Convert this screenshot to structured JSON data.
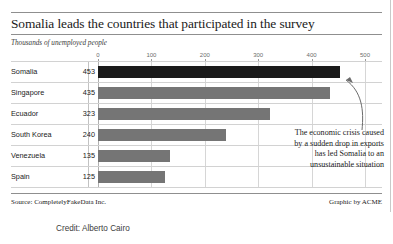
{
  "header": {
    "title": "Somalia leads the countries that participated in the survey",
    "subtitle": "Thousands of unemployed people"
  },
  "footer": {
    "source": "Source: CompletelyFakeData Inc.",
    "graphic_by": "Graphic by ACME",
    "credit": "Credit:  Alberto Cairo"
  },
  "annotation": {
    "line1": "The economic crisis caused",
    "line2": "by a sudden drop in exports",
    "line3": "has led Somalia to an",
    "line4": "unsustainable situation",
    "pointer": "curved-arrow-to-somalia-bar"
  },
  "colors": {
    "bar_default": "#757575",
    "bar_highlight": "#1a1a1a",
    "rule": "#8f8f8f",
    "grid": "#d6d6d6"
  },
  "chart_data": {
    "type": "bar",
    "orientation": "horizontal",
    "title": "Somalia leads the countries that participated in the survey",
    "subtitle": "Thousands of unemployed people",
    "xlabel": "",
    "ylabel": "",
    "xlim": [
      0,
      500
    ],
    "xticks": [
      0,
      100,
      200,
      300,
      400,
      500
    ],
    "xtick_labels": [
      "0",
      "100",
      "200",
      "300",
      "400",
      "500"
    ],
    "grid": true,
    "legend": false,
    "highlight_category": "Somalia",
    "categories": [
      "Somalia",
      "Singapore",
      "Ecuador",
      "South Korea",
      "Venezuela",
      "Spain"
    ],
    "values": [
      453,
      435,
      323,
      240,
      135,
      125
    ],
    "value_labels": [
      "453",
      "435",
      "323",
      "240",
      "135",
      "125"
    ]
  }
}
